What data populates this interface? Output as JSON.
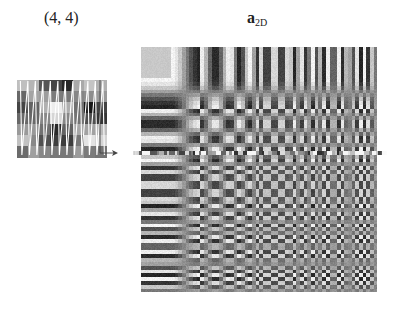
{
  "labels": {
    "patch_position": "(4, 4)",
    "basis_symbol": "a",
    "basis_subscript": "2D"
  },
  "patch": {
    "x": 17,
    "y": 80,
    "width": 90,
    "height": 78,
    "cols": 8,
    "rows": 7,
    "scan_line_color": "#ffffff",
    "scan_order": "column-wise zigzag"
  },
  "arrow": {
    "color": "#444444",
    "from": [
      100,
      80
    ],
    "corner": [
      100,
      153
    ],
    "to": [
      118,
      153
    ]
  },
  "basis": {
    "x": 141,
    "y": 47,
    "width": 236,
    "height": 245,
    "blocks_x": 8,
    "blocks_y": 8,
    "description": "2D DCT basis functions arranged in an 8x8 grid of blocks"
  },
  "highlight_strip": {
    "x": 133,
    "y": 151,
    "width": 254,
    "height": 4,
    "description": "flattened scanned patch row"
  },
  "colors": {
    "background": "#ffffff",
    "text": "#222222",
    "mid_gray": "#8a8a8a"
  }
}
